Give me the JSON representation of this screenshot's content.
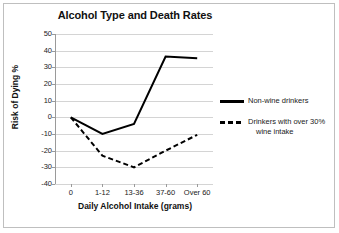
{
  "chart_data": {
    "type": "line",
    "title": "Alcohol Type and Death Rates",
    "xlabel": "Daily Alcohol Intake (grams)",
    "ylabel": "Risk of Dying %",
    "categories": [
      "0",
      "1-12",
      "13-36",
      "37-60",
      "Over 60"
    ],
    "series": [
      {
        "name": "Non-wine drinkers",
        "style": "solid",
        "color": "#000000",
        "values": [
          0,
          -10,
          -4,
          36.5,
          35.5
        ]
      },
      {
        "name": "Drinkers with over 30% wine intake",
        "name_line1": "Drinkers with over 30%",
        "name_line2": "wine intake",
        "style": "dashed",
        "color": "#000000",
        "values": [
          0,
          -23,
          -30,
          -20,
          -10.5
        ]
      }
    ],
    "ylim": [
      -40,
      50
    ],
    "ytick_values": [
      50,
      40,
      30,
      20,
      10,
      0,
      -10,
      -20,
      -30,
      -40
    ],
    "ytick_labels": [
      "50",
      "40",
      "30",
      "20",
      "10",
      "0",
      "-10",
      "-20",
      "-30",
      "-40"
    ],
    "grid": "horizontal",
    "legend_position": "right",
    "gridline_color": "#d4d4d4",
    "axis_color": "#9a9a9a",
    "background": "#ffffff"
  }
}
